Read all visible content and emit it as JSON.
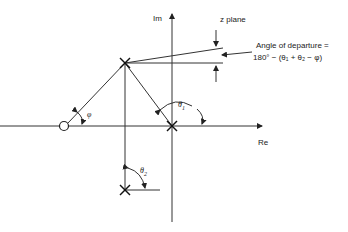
{
  "diagram": {
    "title": "z plane",
    "axes": {
      "imaginary": "Im",
      "real": "Re"
    },
    "annotation_line1": "Angle of departure =",
    "annotation_line2": "180° − (θ₁ + θ₂ − φ)",
    "angles": {
      "theta1": "θ",
      "theta1_sub": "1",
      "theta2": "θ",
      "theta2_sub": "2",
      "phi": "φ"
    },
    "elements": [
      {
        "type": "zero",
        "shape": "circle",
        "x": 64,
        "y": 126
      },
      {
        "type": "pole",
        "shape": "x",
        "x": 125,
        "y": 63
      },
      {
        "type": "pole",
        "shape": "x",
        "x": 172,
        "y": 126
      },
      {
        "type": "pole",
        "shape": "x",
        "x": 125,
        "y": 190
      }
    ]
  }
}
